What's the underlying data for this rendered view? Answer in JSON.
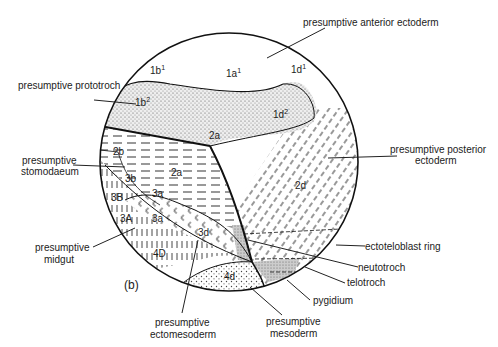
{
  "figure_label": "(b)",
  "regions": {
    "1b1": "1b",
    "1b1_sup": "1",
    "1a1": "1a",
    "1a1_sup": "1",
    "1d1": "1d",
    "1d1_sup": "1",
    "1b2": "1b",
    "1b2_sup": "2",
    "1d2": "1d",
    "1d2_sup": "2",
    "2a_top": "2a",
    "2b": "2b",
    "2a_mid": "2a",
    "3b": "3b",
    "3a_mid": "3a",
    "3B": "3B",
    "3a_low": "3a",
    "3A": "3A",
    "3d": "3d",
    "4D": "4D",
    "4d": "4d",
    "2d": "2d"
  },
  "labels": {
    "anterior_ectoderm": "presumptive anterior ectoderm",
    "prototroch": "presumptive prototroch",
    "posterior_ectoderm_1": "presumptive posterior",
    "posterior_ectoderm_2": "ectoderm",
    "stomodaeum_1": "presumptive",
    "stomodaeum_2": "stomodaeum",
    "ectoteloblast": "ectoteloblast ring",
    "neutotroch": "neutotroch",
    "telotroch": "telotroch",
    "midgut_1": "presumptive",
    "midgut_2": "midgut",
    "pygidium": "pygidium",
    "ectomesoderm_1": "presumptive",
    "ectomesoderm_2": "ectomesoderm",
    "mesoderm_1": "presumptive",
    "mesoderm_2": "mesoderm"
  }
}
